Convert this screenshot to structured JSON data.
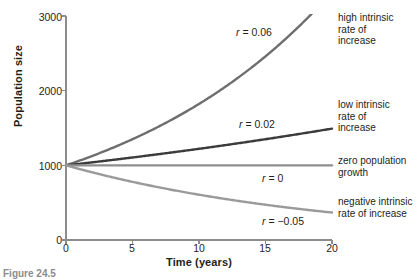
{
  "figure": {
    "number_label": "Figure 24.5"
  },
  "chart_data": {
    "type": "line",
    "title": "",
    "xlabel": "Time (years)",
    "ylabel": "Population size",
    "xlim": [
      0,
      20
    ],
    "ylim": [
      0,
      3000
    ],
    "xticks": [
      0,
      5,
      10,
      15,
      20
    ],
    "xtick_labels": [
      "0",
      "5",
      "10",
      "15",
      "20"
    ],
    "yticks": [
      0,
      1000,
      2000,
      3000
    ],
    "ytick_labels": [
      "0",
      "1000",
      "2000",
      "3000"
    ],
    "grid": false,
    "legend_position": "right-of-axes",
    "model": "N(t) = 1000 * e^(r*t)",
    "initial_population": 1000,
    "x": [
      0,
      2,
      4,
      6,
      8,
      10,
      12,
      14,
      16,
      18,
      20
    ],
    "series": [
      {
        "name": "high intrinsic rate of increase",
        "r": 0.06,
        "annotation": "r = 0.06",
        "annotation_r": "r",
        "annotation_rest": " = 0.06",
        "color": "#6e6e6e",
        "caption_lines": [
          "high intrinsic",
          "rate of",
          "increase"
        ],
        "values": [
          1000,
          1127,
          1271,
          1433,
          1616,
          1822,
          2054,
          2316,
          2611,
          2944,
          3320
        ]
      },
      {
        "name": "low intrinsic rate of increase",
        "r": 0.02,
        "annotation": "r = 0.02",
        "annotation_r": "r",
        "annotation_rest": " = 0.02",
        "color": "#3b3b3b",
        "caption_lines": [
          "low intrinsic",
          "rate of",
          "increase"
        ],
        "values": [
          1000,
          1041,
          1083,
          1127,
          1174,
          1221,
          1271,
          1323,
          1377,
          1433,
          1492
        ]
      },
      {
        "name": "zero population growth",
        "r": 0,
        "annotation": "r = 0",
        "annotation_r": "r",
        "annotation_rest": " = 0",
        "color": "#8f8f8f",
        "caption_lines": [
          "zero population",
          "growth"
        ],
        "values": [
          1000,
          1000,
          1000,
          1000,
          1000,
          1000,
          1000,
          1000,
          1000,
          1000,
          1000
        ]
      },
      {
        "name": "negative intrinsic rate of increase",
        "r": -0.05,
        "annotation": "r = −0.05",
        "annotation_r": "r",
        "annotation_rest": " = −0.05",
        "color": "#9a9a9a",
        "caption_lines": [
          "negative intrinsic",
          "rate of increase"
        ],
        "values": [
          1000,
          905,
          819,
          741,
          670,
          607,
          549,
          497,
          449,
          407,
          368
        ]
      }
    ]
  },
  "axis_colors": {
    "axis_line": "#8c8c8c",
    "text": "#231f20"
  }
}
